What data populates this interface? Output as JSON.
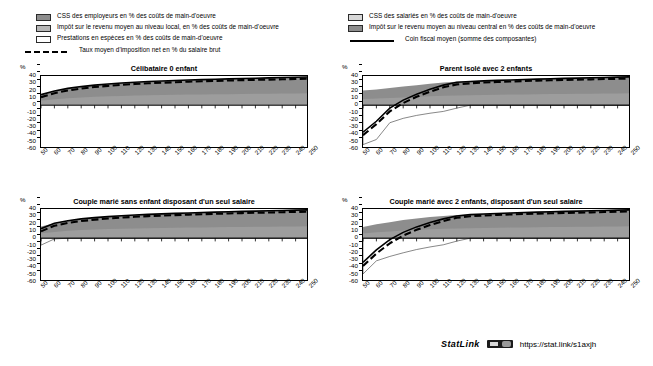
{
  "legend": {
    "left_items": [
      {
        "swatch": "dark-gray",
        "label": "CSS des employeurs en % des coûts de main-d'oeuvre"
      },
      {
        "swatch": "mid-gray",
        "label": "Impôt sur le revenu moyen au niveau local, en % des coûts de main-d'oeuvre"
      },
      {
        "swatch": "white",
        "label": "Prestations en espèces en % des coûts de main-d'oeuvre"
      },
      {
        "swatch": "dashed-line",
        "label": "Taux moyen d'imposition net en % du salaire brut"
      }
    ],
    "right_items": [
      {
        "swatch": "light-gray",
        "label": "CSS des salariés en % des coûts de main-d'oeuvre"
      },
      {
        "swatch": "dark-gray",
        "label": "Impôt sur le revenu moyen au niveau central en %  des coûts de main-d'oeuvre"
      },
      {
        "swatch": "solid-line",
        "label": "Coin fiscal moyen (somme des composantes)"
      }
    ]
  },
  "axis": {
    "y_unit": "%",
    "y_ticks": [
      "40",
      "30",
      "20",
      "10",
      "0",
      "-10",
      "-20",
      "-30",
      "-40",
      "-50",
      "-60"
    ],
    "x_ticks": [
      "50",
      "60",
      "70",
      "80",
      "90",
      "100",
      "110",
      "120",
      "130",
      "140",
      "150",
      "160",
      "170",
      "180",
      "190",
      "200",
      "210",
      "220",
      "230",
      "240",
      "250"
    ]
  },
  "footer": {
    "statlink_word": "StatLink",
    "statlink_badge": "barcode-icon",
    "url": "https://stat.link/s1axjh"
  },
  "colors": {
    "employer_scc": "#8d8d8d",
    "local_income_tax": "#b8b8b8",
    "employee_scc": "#d8d8d8",
    "central_income_tax": "#8d8d8d",
    "cash_benefits": "#ffffff",
    "net_rate_line": "#000000",
    "tax_wedge_line": "#000000"
  },
  "chart_data": [
    {
      "type": "area",
      "title": "Célibataire 0 enfant",
      "xlabel": "",
      "ylabel": "%",
      "xlim": [
        50,
        250
      ],
      "ylim": [
        -60,
        40
      ],
      "grid": false,
      "x": [
        50,
        60,
        70,
        80,
        90,
        100,
        110,
        120,
        130,
        140,
        150,
        160,
        170,
        180,
        190,
        200,
        210,
        220,
        230,
        240,
        250
      ],
      "series": [
        {
          "name": "Coin fiscal moyen (somme des composantes)",
          "type": "line",
          "style": "solid",
          "values": [
            14.5,
            19.5,
            23.0,
            25.5,
            27.5,
            29.0,
            30.4,
            31.5,
            32.4,
            33.2,
            33.9,
            34.5,
            35.1,
            35.6,
            36.1,
            36.6,
            37.0,
            37.5,
            37.9,
            38.3,
            38.7
          ]
        },
        {
          "name": "Taux moyen d'imposition net en % du salaire brut",
          "type": "line",
          "style": "dashed",
          "values": [
            11.0,
            16.5,
            20.2,
            22.8,
            24.9,
            26.5,
            27.9,
            29.0,
            30.0,
            30.8,
            31.5,
            32.2,
            32.8,
            33.3,
            33.8,
            34.3,
            34.7,
            35.1,
            35.5,
            35.9,
            36.3
          ]
        },
        {
          "name": "Composantes empilées (surface grise)",
          "type": "stacked-area",
          "values": [
            14.5,
            19.5,
            23.0,
            25.5,
            27.5,
            29.0,
            30.4,
            31.5,
            32.4,
            33.2,
            33.9,
            34.5,
            35.1,
            35.6,
            36.1,
            36.6,
            37.0,
            37.5,
            37.9,
            38.3,
            38.7
          ]
        },
        {
          "name": "Prestations en espèces en % des coûts de main-d'oeuvre",
          "type": "area",
          "values": [
            0,
            0,
            0,
            0,
            0,
            0,
            0,
            0,
            0,
            0,
            0,
            0,
            0,
            0,
            0,
            0,
            0,
            0,
            0,
            0,
            0
          ]
        }
      ]
    },
    {
      "type": "area",
      "title": "Parent isolé avec 2 enfants",
      "xlabel": "",
      "ylabel": "%",
      "xlim": [
        50,
        250
      ],
      "ylim": [
        -60,
        40
      ],
      "grid": false,
      "x": [
        50,
        60,
        70,
        80,
        90,
        100,
        110,
        120,
        130,
        140,
        150,
        160,
        170,
        180,
        190,
        200,
        210,
        220,
        230,
        240,
        250
      ],
      "series": [
        {
          "name": "Coin fiscal moyen (somme des composantes)",
          "type": "line",
          "style": "solid",
          "values": [
            -37.0,
            -22.0,
            -4.0,
            7.0,
            15.0,
            22.0,
            27.5,
            31.5,
            32.5,
            33.3,
            34.0,
            34.6,
            35.2,
            35.7,
            36.2,
            36.7,
            37.1,
            37.6,
            38.0,
            38.4,
            38.8
          ]
        },
        {
          "name": "Taux moyen d'imposition net en % du salaire brut",
          "type": "line",
          "style": "dashed",
          "values": [
            -41.0,
            -26.0,
            -8.5,
            3.0,
            11.5,
            18.5,
            24.5,
            28.5,
            30.0,
            31.0,
            31.8,
            32.5,
            33.1,
            33.6,
            34.1,
            34.6,
            35.0,
            35.4,
            35.8,
            36.2,
            36.6
          ]
        },
        {
          "name": "Prestations en espèces en % des coûts de main-d'oeuvre",
          "type": "area",
          "style": "thin-outline",
          "values": [
            -54.0,
            -47.0,
            -24.0,
            -18.0,
            -14.0,
            -11.0,
            -8.5,
            -4.0,
            0,
            0,
            0,
            0,
            0,
            0,
            0,
            0,
            0,
            0,
            0,
            0,
            0
          ]
        },
        {
          "name": "Composantes empilées (surface grise)",
          "type": "stacked-area",
          "values": [
            20.0,
            21.5,
            23.5,
            25.5,
            27.5,
            29.5,
            31.0,
            32.0,
            32.8,
            33.4,
            34.0,
            34.6,
            35.2,
            35.7,
            36.2,
            36.7,
            37.1,
            37.6,
            38.0,
            38.4,
            38.8
          ]
        }
      ]
    },
    {
      "type": "area",
      "title": "Couple marié sans enfant disposant d'un seul salaire",
      "xlabel": "",
      "ylabel": "%",
      "xlim": [
        50,
        250
      ],
      "ylim": [
        -60,
        40
      ],
      "grid": false,
      "x": [
        50,
        60,
        70,
        80,
        90,
        100,
        110,
        120,
        130,
        140,
        150,
        160,
        170,
        180,
        190,
        200,
        210,
        220,
        230,
        240,
        250
      ],
      "series": [
        {
          "name": "Coin fiscal moyen (somme des composantes)",
          "type": "line",
          "style": "solid",
          "values": [
            13.0,
            20.5,
            24.0,
            26.5,
            28.2,
            29.6,
            30.8,
            31.8,
            32.6,
            33.3,
            34.0,
            34.6,
            35.2,
            35.7,
            36.2,
            36.7,
            37.1,
            37.6,
            38.0,
            38.4,
            38.8
          ]
        },
        {
          "name": "Taux moyen d'imposition net en % du salaire brut",
          "type": "line",
          "style": "dashed",
          "values": [
            9.5,
            17.0,
            20.8,
            23.5,
            25.4,
            26.9,
            28.2,
            29.3,
            30.2,
            30.9,
            31.6,
            32.3,
            32.9,
            33.4,
            33.9,
            34.4,
            34.8,
            35.2,
            35.6,
            36.0,
            36.4
          ]
        },
        {
          "name": "Prestations en espèces en % des coûts de main-d'oeuvre",
          "type": "area",
          "style": "thin-outline",
          "values": [
            -9.5,
            -1.0,
            0,
            0,
            0,
            0,
            0,
            0,
            0,
            0,
            0,
            0,
            0,
            0,
            0,
            0,
            0,
            0,
            0,
            0,
            0
          ]
        },
        {
          "name": "Composantes empilées (surface grise)",
          "type": "stacked-area",
          "values": [
            16.0,
            20.5,
            24.0,
            26.5,
            28.2,
            29.6,
            30.8,
            31.8,
            32.6,
            33.3,
            34.0,
            34.6,
            35.2,
            35.7,
            36.2,
            36.7,
            37.1,
            37.6,
            38.0,
            38.4,
            38.8
          ]
        }
      ]
    },
    {
      "type": "area",
      "title": "Couple marié avec 2 enfants, disposant d'un seul salaire",
      "xlabel": "",
      "ylabel": "%",
      "xlim": [
        50,
        250
      ],
      "ylim": [
        -60,
        40
      ],
      "grid": false,
      "x": [
        50,
        60,
        70,
        80,
        90,
        100,
        110,
        120,
        130,
        140,
        150,
        160,
        170,
        180,
        190,
        200,
        210,
        220,
        230,
        240,
        250
      ],
      "series": [
        {
          "name": "Coin fiscal moyen (somme des composantes)",
          "type": "line",
          "style": "solid",
          "values": [
            -33.0,
            -16.0,
            -2.0,
            8.0,
            15.5,
            21.5,
            26.5,
            30.5,
            32.3,
            33.2,
            33.9,
            34.6,
            35.2,
            35.7,
            36.2,
            36.7,
            37.1,
            37.6,
            38.0,
            38.4,
            38.8
          ]
        },
        {
          "name": "Taux moyen d'imposition net en % du salaire brut",
          "type": "line",
          "style": "dashed",
          "values": [
            -38.0,
            -21.0,
            -7.0,
            3.5,
            11.5,
            18.0,
            23.5,
            28.0,
            30.0,
            31.0,
            31.8,
            32.5,
            33.1,
            33.6,
            34.1,
            34.6,
            35.0,
            35.4,
            35.8,
            36.2,
            36.6
          ]
        },
        {
          "name": "Prestations en espèces en % des coûts de main-d'oeuvre",
          "type": "area",
          "style": "thin-outline",
          "values": [
            -49.0,
            -31.0,
            -25.0,
            -20.0,
            -15.5,
            -12.0,
            -9.0,
            -4.0,
            0,
            0,
            0,
            0,
            0,
            0,
            0,
            0,
            0,
            0,
            0,
            0,
            0
          ]
        },
        {
          "name": "Composantes empilées (surface grise)",
          "type": "stacked-area",
          "values": [
            15.5,
            19.0,
            22.0,
            25.0,
            27.0,
            29.0,
            30.5,
            31.8,
            32.5,
            33.2,
            33.9,
            34.6,
            35.2,
            35.7,
            36.2,
            36.7,
            37.1,
            37.6,
            38.0,
            38.4,
            38.8
          ]
        }
      ]
    }
  ]
}
